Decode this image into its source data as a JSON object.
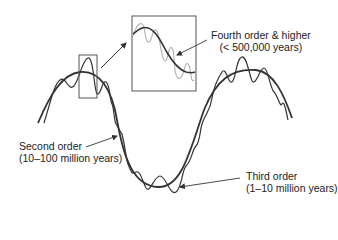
{
  "diagram": {
    "type": "sea-level-cycle-orders",
    "labels": {
      "fourth_order": {
        "title": "Fourth order & higher",
        "period": "(< 500,000 years)"
      },
      "second_order": {
        "title": "Second order",
        "period": "(10–100 million years)"
      },
      "third_order": {
        "title": "Third order",
        "period": "(1–10 million years)"
      }
    },
    "elements": {
      "second_order_curve": "smooth long-period wave",
      "third_order_curve": "higher-frequency oscillation superimposed on second-order curve",
      "fourth_order_curve": "light gray high-frequency oscillation shown in magnified inset",
      "zoom_box": "small rectangle on the first peak",
      "inset_box": "magnified view of the zoom box region",
      "zoom_arrow": "arrow from small rectangle to inset"
    },
    "colors": {
      "line": "#333333",
      "fourth_order_line": "#b0b0b0",
      "box": "#555555",
      "text": "#222222",
      "background": "#ffffff"
    }
  }
}
